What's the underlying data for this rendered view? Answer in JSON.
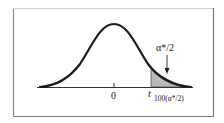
{
  "figure": {
    "type": "t-distribution-upper-tail-diagram",
    "center_label": "0",
    "critical_value_label": {
      "symbol": "t",
      "subscript": "100(α*/2)"
    },
    "tail_area_label": "α*/2",
    "colors": {
      "curve": "#1a1a1a",
      "shade": "#b8b8b8",
      "frame_left_top": "#9a9a9a",
      "frame_right_bottom": "#7a7a7a",
      "axis": "#333333"
    }
  }
}
